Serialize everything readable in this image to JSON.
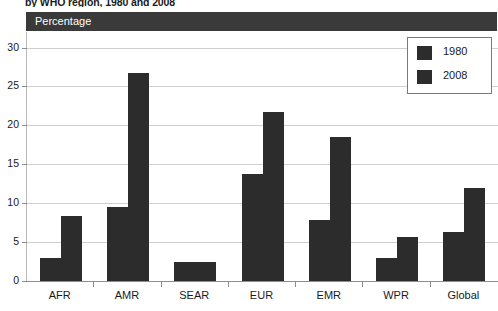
{
  "figure": {
    "title": "by WHO region, 1980 and 2008",
    "axis_band_label": "Percentage"
  },
  "legend": {
    "items": [
      {
        "label": "1980",
        "color": "#2c2c2c"
      },
      {
        "label": "2008",
        "color": "#2c2c2c"
      }
    ]
  },
  "chart_data": {
    "type": "bar",
    "title": "by WHO region, 1980 and 2008",
    "xlabel": "",
    "ylabel": "Percentage",
    "ylim": [
      0,
      32
    ],
    "yticks": [
      0,
      5,
      10,
      15,
      20,
      25,
      30
    ],
    "ytick_labels": [
      "0",
      "5",
      "10",
      "15",
      "20",
      "25",
      "30"
    ],
    "grid": true,
    "legend_position": "top-right",
    "categories": [
      "AFR",
      "AMR",
      "SEAR",
      "EUR",
      "EMR",
      "WPR",
      "Global"
    ],
    "series": [
      {
        "name": "1980",
        "color": "#2c2c2c",
        "values": [
          3.0,
          9.5,
          2.4,
          13.8,
          7.8,
          2.9,
          6.3
        ]
      },
      {
        "name": "2008",
        "color": "#2c2c2c",
        "values": [
          8.3,
          26.7,
          2.5,
          21.7,
          18.5,
          5.6,
          12.0
        ]
      }
    ]
  }
}
